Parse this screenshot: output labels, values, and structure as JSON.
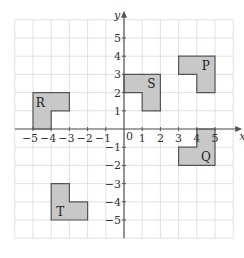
{
  "diagram": {
    "type": "coordinate-grid",
    "axes": {
      "x_label": "x",
      "y_label": "y",
      "x_range": [
        -6,
        6
      ],
      "y_range": [
        -6,
        6
      ],
      "x_ticks": [
        -5,
        -4,
        -3,
        -2,
        -1,
        1,
        2,
        3,
        4,
        5
      ],
      "y_ticks": [
        -5,
        -4,
        -3,
        -2,
        -1,
        1,
        2,
        3,
        4,
        5
      ],
      "origin_label": "0"
    },
    "colors": {
      "grid": "#d9d9d9",
      "axis": "#555555",
      "shape_fill": "#c8c8c8",
      "shape_stroke": "#555555"
    },
    "shapes": [
      {
        "label": "R",
        "points": [
          [
            -5,
            0
          ],
          [
            -5,
            2
          ],
          [
            -3,
            2
          ],
          [
            -3,
            1
          ],
          [
            -4,
            1
          ],
          [
            -4,
            0
          ]
        ],
        "label_pos": [
          -4.6,
          1.45
        ]
      },
      {
        "label": "S",
        "points": [
          [
            0,
            2
          ],
          [
            0,
            3
          ],
          [
            2,
            3
          ],
          [
            2,
            1
          ],
          [
            1,
            1
          ],
          [
            1,
            2
          ]
        ],
        "label_pos": [
          1.5,
          2.45
        ]
      },
      {
        "label": "P",
        "points": [
          [
            3,
            3
          ],
          [
            3,
            4
          ],
          [
            5,
            4
          ],
          [
            5,
            2
          ],
          [
            4,
            2
          ],
          [
            4,
            3
          ]
        ],
        "label_pos": [
          4.5,
          3.45
        ]
      },
      {
        "label": "Q",
        "points": [
          [
            4,
            0
          ],
          [
            5,
            0
          ],
          [
            5,
            -2
          ],
          [
            3,
            -2
          ],
          [
            3,
            -1
          ],
          [
            4,
            -1
          ]
        ],
        "label_pos": [
          4.5,
          -1.55
        ]
      },
      {
        "label": "T",
        "points": [
          [
            -4,
            -3
          ],
          [
            -3,
            -3
          ],
          [
            -3,
            -4
          ],
          [
            -2,
            -4
          ],
          [
            -2,
            -5
          ],
          [
            -4,
            -5
          ]
        ],
        "label_pos": [
          -3.5,
          -4.55
        ]
      }
    ]
  }
}
